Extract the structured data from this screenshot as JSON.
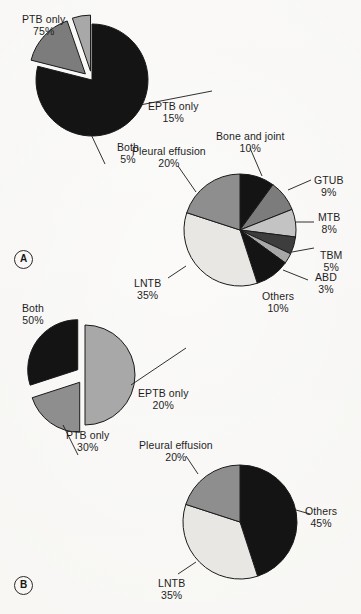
{
  "figure": {
    "background_color": "#f7f6f3",
    "text_color": "#1e1e1e",
    "panels": [
      {
        "id": "A",
        "tag": "A"
      },
      {
        "id": "B",
        "tag": "B"
      }
    ]
  },
  "palette": {
    "black": "#141414",
    "dark_gray": "#3d3d3d",
    "mid_gray": "#7c7c7c",
    "gray": "#8e8e8e",
    "light_gray": "#a8a8a8",
    "lighter_gray": "#c3c3c3",
    "pale": "#e8e7e3",
    "outline": "#1a1a1a"
  },
  "chart_data": [
    {
      "id": "panel-a-tb-type",
      "type": "pie",
      "panel": "A",
      "title": "",
      "center": [
        92,
        80
      ],
      "radius": 56,
      "start_angle": -90,
      "categories": [
        "PTB only",
        "EPTB only",
        "Both"
      ],
      "values": [
        75,
        15,
        5
      ],
      "display_values": [
        "75%",
        "15%",
        "5%"
      ],
      "colors": [
        "#141414",
        "#7c7c7c",
        "#a8a8a8"
      ],
      "exploded": [
        false,
        true,
        true
      ],
      "labels": [
        {
          "text": "PTB only",
          "pct": "75%",
          "x": 22,
          "y": 14,
          "align": "left"
        },
        {
          "text": "EPTB only",
          "pct": "15%",
          "x": 148,
          "y": 101,
          "align": "left"
        },
        {
          "text": "Both",
          "pct": "5%",
          "x": 117,
          "y": 142,
          "align": "left"
        }
      ]
    },
    {
      "id": "panel-a-eptb-sites",
      "type": "pie",
      "panel": "A",
      "title": "",
      "center": [
        240,
        230
      ],
      "radius": 56,
      "start_angle": -90,
      "categories": [
        "Bone and joint",
        "GTUB",
        "MTB",
        "TBM",
        "ABD",
        "Others",
        "LNTB",
        "Pleural effusion"
      ],
      "values": [
        10,
        9,
        8,
        5,
        3,
        10,
        35,
        20
      ],
      "display_values": [
        "10%",
        "9%",
        "8%",
        "5%",
        "3%",
        "10%",
        "35%",
        "20%"
      ],
      "colors": [
        "#141414",
        "#7c7c7c",
        "#c3c3c3",
        "#3d3d3d",
        "#a8a8a8",
        "#141414",
        "#e8e7e3",
        "#8e8e8e"
      ],
      "exploded": [
        false,
        false,
        false,
        false,
        false,
        false,
        false,
        false
      ],
      "labels": [
        {
          "text": "Bone and joint",
          "pct": "10%",
          "x": 216,
          "y": 131,
          "align": "left"
        },
        {
          "text": "GTUB",
          "pct": "9%",
          "x": 314,
          "y": 175,
          "align": "left"
        },
        {
          "text": "MTB",
          "pct": "8%",
          "x": 318,
          "y": 212,
          "align": "left"
        },
        {
          "text": "TBM",
          "pct": "5%",
          "x": 320,
          "y": 250,
          "align": "left"
        },
        {
          "text": "ABD",
          "pct": "3%",
          "x": 315,
          "y": 272,
          "align": "left"
        },
        {
          "text": "Others",
          "pct": "10%",
          "x": 262,
          "y": 291,
          "align": "left"
        },
        {
          "text": "LNTB",
          "pct": "35%",
          "x": 134,
          "y": 278,
          "align": "left"
        },
        {
          "text": "Pleural effusion",
          "pct": "20%",
          "x": 132,
          "y": 146,
          "align": "left"
        }
      ]
    },
    {
      "id": "panel-b-tb-type",
      "type": "pie",
      "panel": "B",
      "title": "",
      "center": [
        85,
        375
      ],
      "radius": 50,
      "start_angle": -90,
      "categories": [
        "Both",
        "EPTB only",
        "PTB only"
      ],
      "values": [
        50,
        20,
        30
      ],
      "display_values": [
        "50%",
        "20%",
        "30%"
      ],
      "colors": [
        "#a8a8a8",
        "#8e8e8e",
        "#141414"
      ],
      "exploded": [
        false,
        true,
        true
      ],
      "labels": [
        {
          "text": "Both",
          "pct": "50%",
          "x": 22,
          "y": 303,
          "align": "left"
        },
        {
          "text": "EPTB only",
          "pct": "20%",
          "x": 138,
          "y": 388,
          "align": "left"
        },
        {
          "text": "PTB only",
          "pct": "30%",
          "x": 66,
          "y": 430,
          "align": "left"
        }
      ]
    },
    {
      "id": "panel-b-eptb-sites",
      "type": "pie",
      "panel": "B",
      "title": "",
      "center": [
        240,
        522
      ],
      "radius": 57,
      "start_angle": -90,
      "categories": [
        "Others",
        "LNTB",
        "Pleural effusion"
      ],
      "values": [
        45,
        35,
        20
      ],
      "display_values": [
        "45%",
        "35%",
        "20%"
      ],
      "colors": [
        "#141414",
        "#e8e7e3",
        "#8e8e8e"
      ],
      "exploded": [
        false,
        false,
        false
      ],
      "labels": [
        {
          "text": "Others",
          "pct": "45%",
          "x": 305,
          "y": 506,
          "align": "left"
        },
        {
          "text": "LNTB",
          "pct": "35%",
          "x": 158,
          "y": 578,
          "align": "left"
        },
        {
          "text": "Pleural effusion",
          "pct": "20%",
          "x": 139,
          "y": 440,
          "align": "left"
        }
      ]
    }
  ],
  "leader_lines": [
    {
      "name": "eptb-only-a",
      "x1": 140,
      "y1": 105,
      "x2": 212,
      "y2": 91
    },
    {
      "name": "both-a",
      "x1": 88,
      "y1": 128,
      "x2": 105,
      "y2": 164
    },
    {
      "name": "bone-joint-a",
      "x1": 250,
      "y1": 148,
      "x2": 262,
      "y2": 176
    },
    {
      "name": "gtub-a",
      "x1": 288,
      "y1": 190,
      "x2": 311,
      "y2": 180
    },
    {
      "name": "mtb-a",
      "x1": 296,
      "y1": 222,
      "x2": 314,
      "y2": 222
    },
    {
      "name": "tbm-a",
      "x1": 292,
      "y1": 252,
      "x2": 314,
      "y2": 248
    },
    {
      "name": "abd-a",
      "x1": 283,
      "y1": 270,
      "x2": 308,
      "y2": 280
    },
    {
      "name": "lntb-a",
      "x1": 186,
      "y1": 266,
      "x2": 168,
      "y2": 278
    },
    {
      "name": "pleural-a",
      "x1": 196,
      "y1": 192,
      "x2": 178,
      "y2": 166
    },
    {
      "name": "eptb-only-b",
      "x1": 131,
      "y1": 385,
      "x2": 186,
      "y2": 348
    },
    {
      "name": "ptb-only-b",
      "x1": 63,
      "y1": 425,
      "x2": 78,
      "y2": 455
    },
    {
      "name": "others-b",
      "x1": 296,
      "y1": 510,
      "x2": 310,
      "y2": 514
    },
    {
      "name": "lntb-b",
      "x1": 196,
      "y1": 562,
      "x2": 178,
      "y2": 574
    },
    {
      "name": "pleural-b",
      "x1": 198,
      "y1": 474,
      "x2": 186,
      "y2": 456
    }
  ],
  "panel_tags": [
    {
      "label": "A",
      "x": 14,
      "y": 250
    },
    {
      "label": "B",
      "x": 14,
      "y": 576
    }
  ]
}
